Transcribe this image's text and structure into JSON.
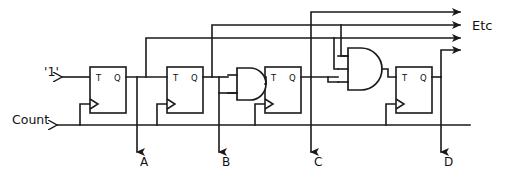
{
  "diagram": {
    "type": "logic-circuit-schematic",
    "background_color": "#ffffff",
    "line_color": "#1a1a1a"
  },
  "inputs": [
    {
      "id": "one",
      "label": "'1'",
      "x": 42,
      "y": 74
    },
    {
      "id": "count",
      "label": "Count",
      "x": 10,
      "y": 120
    }
  ],
  "outputs": [
    {
      "id": "a",
      "label": "A",
      "x": 134,
      "y": 168
    },
    {
      "id": "b",
      "label": "B",
      "x": 224,
      "y": 168
    },
    {
      "id": "c",
      "label": "C",
      "x": 314,
      "y": 168
    },
    {
      "id": "d",
      "label": "D",
      "x": 444,
      "y": 168
    }
  ],
  "continuation": {
    "label": "Etc",
    "x": 470,
    "y": 30
  },
  "flipflops": [
    {
      "id": "ff-a",
      "t_label": "T",
      "q_label": "Q",
      "x": 90,
      "y": 67,
      "w": 36,
      "h": 46
    },
    {
      "id": "ff-b",
      "t_label": "T",
      "q_label": "Q",
      "x": 167,
      "y": 67,
      "w": 36,
      "h": 46
    },
    {
      "id": "ff-c",
      "t_label": "T",
      "q_label": "Q",
      "x": 265,
      "y": 67,
      "w": 36,
      "h": 46
    },
    {
      "id": "ff-d",
      "t_label": "T",
      "q_label": "Q",
      "x": 396,
      "y": 67,
      "w": 36,
      "h": 46
    }
  ],
  "gates": [
    {
      "id": "and-1",
      "kind": "AND",
      "inputs": 2,
      "x": 237,
      "y": 68
    },
    {
      "id": "and-2",
      "kind": "AND",
      "inputs": 3,
      "x": 348,
      "y": 48
    }
  ],
  "bus_lines": [
    {
      "id": "etc-bus-1",
      "y": 12
    },
    {
      "id": "etc-bus-2",
      "y": 25
    },
    {
      "id": "etc-bus-3",
      "y": 38
    },
    {
      "id": "etc-bus-4",
      "y": 50
    }
  ]
}
